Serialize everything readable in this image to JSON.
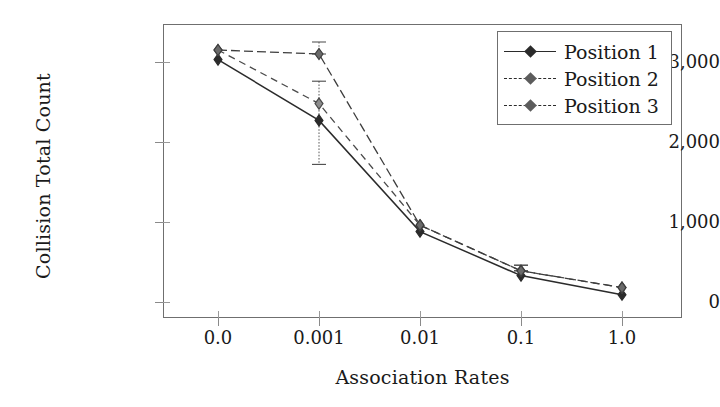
{
  "chart_data": {
    "type": "line",
    "title": "",
    "xlabel": "Association Rates",
    "ylabel": "Collision Total Count",
    "categories": [
      "0.0",
      "0.001",
      "0.01",
      "0.1",
      "1.0"
    ],
    "xticklabels": [
      "0.0",
      "0.001",
      "0.01",
      "0.1",
      "1.0"
    ],
    "yticklabels": [
      "0",
      "1,000",
      "2,000",
      "3,000"
    ],
    "ytickvalues": [
      0,
      1000,
      2000,
      3000
    ],
    "ylim": [
      -190,
      3300
    ],
    "xlim": [
      -0.55,
      4.55
    ],
    "grid": false,
    "legend_position": "top-right",
    "series": [
      {
        "name": "Position 1",
        "linestyle": "solid",
        "marker": "diamond-filled",
        "color": "#2b2b2b",
        "values": [
          3030,
          2270,
          880,
          330,
          90
        ],
        "errors_low": [
          3030,
          1720,
          880,
          330,
          90
        ],
        "errors_high": [
          3030,
          2760,
          880,
          330,
          90
        ]
      },
      {
        "name": "Position 2",
        "linestyle": "dashed",
        "marker": "diamond-open",
        "color": "#4a4a4a",
        "values": [
          3150,
          2480,
          960,
          390,
          180
        ],
        "errors_low": [
          3150,
          2480,
          960,
          390,
          180
        ],
        "errors_high": [
          3150,
          2480,
          960,
          460,
          180
        ]
      },
      {
        "name": "Position 3",
        "linestyle": "dashed",
        "marker": "diamond-half",
        "color": "#3d3d3d",
        "values": [
          3150,
          3100,
          960,
          390,
          180
        ],
        "errors_low": [
          3150,
          3100,
          960,
          390,
          180
        ],
        "errors_high": [
          3150,
          3250,
          960,
          460,
          180
        ]
      }
    ]
  },
  "legend": {
    "items": [
      {
        "label": "Position 1"
      },
      {
        "label": "Position 2"
      },
      {
        "label": "Position 3"
      }
    ]
  },
  "axes": {
    "y_title": "Collision Total Count",
    "x_title": "Association Rates"
  },
  "colors": {
    "frame": "#6f6f6f",
    "series_1": "#2b2b2b",
    "series_2": "#4a4a4a",
    "series_3": "#3d3d3d",
    "background": "#ffffff"
  }
}
